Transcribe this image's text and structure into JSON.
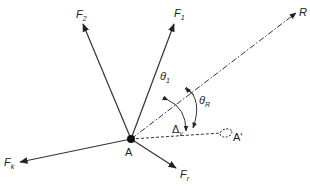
{
  "diagram": {
    "type": "force-vector-diagram",
    "point": {
      "label": "A"
    },
    "displaced_point": {
      "label": "A'"
    },
    "forces": [
      {
        "id": "F1",
        "base": "F",
        "sub": "1"
      },
      {
        "id": "F2",
        "base": "F",
        "sub": "2"
      },
      {
        "id": "Fk",
        "base": "F",
        "sub": "k"
      },
      {
        "id": "Fr",
        "base": "F",
        "sub": "r"
      }
    ],
    "resultant": {
      "label": "R"
    },
    "angles": [
      {
        "id": "theta1",
        "base": "θ",
        "sub": "1"
      },
      {
        "id": "thetaR",
        "base": "θ",
        "sub": "R"
      }
    ],
    "displacement": {
      "base": "Δ",
      "sub": "v"
    },
    "colors": {
      "stroke": "#333333",
      "background": "#ffffff"
    }
  }
}
